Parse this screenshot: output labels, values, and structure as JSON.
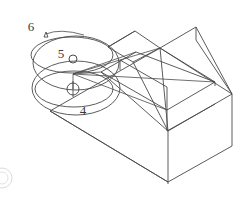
{
  "drawing": {
    "type": "isometric-technical-drawing",
    "background_color": "#ffffff",
    "line_color": "#4a4a4a",
    "faint_line_color": "#c9c9c9",
    "description": "Isometric view of a rectangular block with a sloped chamfered top face and a rectangular pocket, annotated with three balloon callouts."
  },
  "callouts": [
    {
      "id": "callout-6",
      "label": "6",
      "marker": "triangle",
      "label_x": 31,
      "label_y": 31,
      "marker_x": 44,
      "marker_y": 34,
      "ellipse": {
        "cx": 76,
        "cy": 63,
        "rx": 43,
        "ry": 27
      }
    },
    {
      "id": "callout-5",
      "label": "5",
      "marker": "circle",
      "label_x": 61,
      "label_y": 58,
      "marker_x": 73,
      "marker_y": 59,
      "ellipse": {
        "cx": 72,
        "cy": 55,
        "rx": 41,
        "ry": 18
      }
    },
    {
      "id": "callout-4",
      "label": "4",
      "marker": "circle-crosshair",
      "label_x": 83,
      "label_y": 115,
      "marker_x": 73,
      "marker_y": 89,
      "ellipse": {
        "cx": 74,
        "cy": 89,
        "rx": 39,
        "ry": 18
      }
    }
  ],
  "outer_ellipse": {
    "cx": 76,
    "cy": 88,
    "rx": 44,
    "ry": 27
  },
  "leader_lines": {
    "origin_x": 73,
    "origin_y": 74,
    "count": 4,
    "description": "Leader lines fan from the callout cluster toward features on the block"
  },
  "artifact": {
    "name": "page-edge-circle",
    "cx": 2,
    "cy": 178,
    "r": 10
  }
}
